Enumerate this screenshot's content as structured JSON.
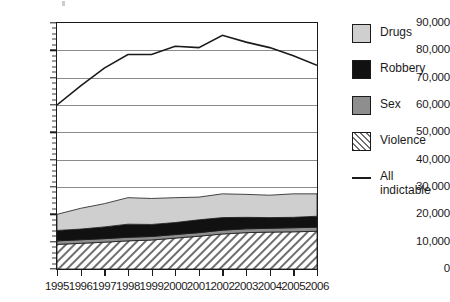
{
  "chart_data": {
    "type": "area",
    "title": "",
    "subtitle": "",
    "xlabel": "",
    "ylabel": "",
    "categories": [
      "1995",
      "1996",
      "1997",
      "1998",
      "1999",
      "2000",
      "2001",
      "2002",
      "2003",
      "2004",
      "2005",
      "2006"
    ],
    "ylim": [
      0,
      90000
    ],
    "ytick_values": [
      0,
      10000,
      20000,
      30000,
      40000,
      50000,
      60000,
      70000,
      80000,
      90000
    ],
    "ytick_labels": [
      "0",
      "10,000",
      "20,000",
      "30,000",
      "40,000",
      "50,000",
      "60,000",
      "70,000",
      "80,000",
      "90,000"
    ],
    "grid": true,
    "minor_ticks": true,
    "legend_position": "right",
    "stacking_order": [
      "Violence",
      "Sex",
      "Robbery",
      "Drugs"
    ],
    "series": [
      {
        "name": "Violence",
        "type": "area",
        "color": "#ffffff",
        "pattern": "diagonal-hatch",
        "values": [
          9000,
          9400,
          9800,
          10300,
          10600,
          11300,
          12000,
          12800,
          13300,
          13500,
          13600,
          13800
        ]
      },
      {
        "name": "Sex",
        "type": "area",
        "color": "#8e8e8e",
        "values": [
          1300,
          1300,
          1300,
          1300,
          1300,
          1300,
          1300,
          1400,
          1400,
          1400,
          1500,
          1500
        ]
      },
      {
        "name": "Robbery",
        "type": "area",
        "color": "#111111",
        "values": [
          3800,
          3900,
          4300,
          4800,
          4400,
          4400,
          4700,
          4600,
          4200,
          3900,
          3800,
          4000
        ]
      },
      {
        "name": "Drugs",
        "type": "area",
        "color": "#cfcfcf",
        "values": [
          5900,
          7600,
          8500,
          9700,
          9500,
          9100,
          8300,
          8700,
          8400,
          8200,
          8600,
          8200
        ]
      },
      {
        "name": "All indictable",
        "type": "line",
        "color": "#1b1b1b",
        "values": [
          60000,
          67000,
          73500,
          78500,
          78500,
          81500,
          81000,
          85500,
          83000,
          81000,
          78000,
          74500
        ]
      }
    ],
    "stacked_totals": [
      20000,
      22200,
      23900,
      26100,
      25800,
      26100,
      26300,
      27500,
      27300,
      27000,
      27500,
      27500
    ]
  },
  "legend": {
    "items": [
      {
        "label": "Drugs",
        "swatch": "swatch-solid-light-gray"
      },
      {
        "label": "Robbery",
        "swatch": "swatch-solid-black"
      },
      {
        "label": "Sex",
        "swatch": "swatch-solid-gray"
      },
      {
        "label": "Violence",
        "swatch": "swatch-hatched"
      },
      {
        "label": "All",
        "label2": "indictable",
        "swatch": "swatch-line"
      }
    ]
  }
}
